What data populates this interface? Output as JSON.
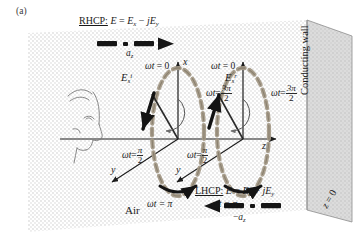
{
  "figure": {
    "panel_label": "(a)",
    "caption_topic": "Circularly polarized plane wave reflection from a conducting wall"
  },
  "annotations": {
    "rhcp": {
      "prefix": "RHCP:",
      "equation_E": "E",
      "equals": "=",
      "term1_base": "E",
      "term1_sub": "x",
      "minus": "−",
      "term2_j": "j",
      "term2_base": "E",
      "term2_sub": "y",
      "direction_label_base": "a",
      "direction_label_sub": "z"
    },
    "lhcp": {
      "prefix": "LHCP:",
      "equation_E": "E",
      "equals": "=",
      "term1_base": "E",
      "term1_sub": "x",
      "plus": "+",
      "term2_j": "j",
      "term2_base": "E",
      "term2_sub": "y",
      "direction_label_minus": "−",
      "direction_label_base": "a",
      "direction_label_sub": "z"
    },
    "media": {
      "air": "Air",
      "wall": "Conducting wall",
      "wall_plane_z": "z",
      "wall_plane_eq": "= 0"
    }
  },
  "axes": {
    "x_label": "x",
    "y_label_left": "y",
    "y_label_right": "y",
    "z_label": "z"
  },
  "incident": {
    "field_base": "E",
    "field_sub": "s",
    "field_sup": "i",
    "phases": {
      "top": {
        "omega": "ωt",
        "eq": "= 0"
      },
      "right": {
        "omega": "ωt",
        "eq": "=",
        "num": "3π",
        "den": "2"
      },
      "left": {
        "omega": "ωt",
        "eq": "=",
        "num": "π",
        "den": "2"
      },
      "bottom": {
        "omega": "ωt",
        "eq": "= π"
      }
    }
  },
  "reflected": {
    "field_base": "E",
    "field_sub": "s",
    "field_sup": "r",
    "phases": {
      "top": {
        "omega": "ωt",
        "eq": "= 0"
      },
      "right": {
        "omega": "ωt",
        "eq": "=",
        "num": "3π",
        "den": "2"
      },
      "left": {
        "omega": "ωt",
        "eq": "=",
        "num": "π",
        "den": "2"
      },
      "bottom": {
        "omega": "ωt",
        "eq": "= π"
      }
    }
  },
  "colors": {
    "ink": "#1a1a1a",
    "ellipse_dash": "#9a9285",
    "wall_fill": "#d8d8d8",
    "stipple": "#b9b9b9"
  }
}
